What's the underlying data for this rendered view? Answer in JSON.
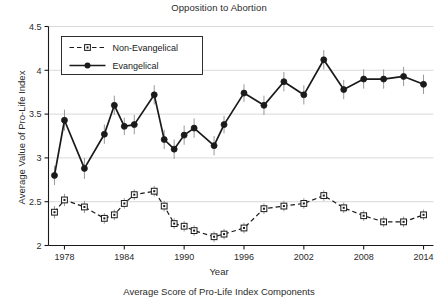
{
  "chart_data": {
    "type": "line",
    "title": "Opposition to Abortion",
    "caption": "Average Score of Pro-Life Index Components",
    "xlabel": "Year",
    "ylabel": "Average Value of Pro-Life Index",
    "xlim": [
      1976.4,
      2015.0
    ],
    "ylim": [
      2.0,
      4.5
    ],
    "xticks": [
      1978,
      1984,
      1990,
      1996,
      2002,
      2008,
      2014
    ],
    "yticks": [
      2,
      2.5,
      3,
      3.5,
      4,
      4.5
    ],
    "ytick_labels": [
      "2",
      "2.5",
      "3",
      "3.5",
      "4",
      "4.5"
    ],
    "xtick_labels": [
      "1978",
      "1984",
      "1990",
      "1996",
      "2002",
      "2008",
      "2014"
    ],
    "grid": "horizontal",
    "legend_position": "top-left",
    "error_bars": true,
    "series": [
      {
        "name": "Evangelical",
        "marker": "filled-circle",
        "linestyle": "solid",
        "color": "#1a1a1a",
        "x": [
          1977,
          1978,
          1980,
          1982,
          1983,
          1984,
          1985,
          1987,
          1988,
          1989,
          1990,
          1991,
          1993,
          1994,
          1996,
          1998,
          2000,
          2002,
          2004,
          2006,
          2008,
          2010,
          2012,
          2014
        ],
        "y": [
          2.8,
          3.43,
          2.88,
          3.27,
          3.6,
          3.36,
          3.38,
          3.72,
          3.21,
          3.1,
          3.26,
          3.34,
          3.14,
          3.38,
          3.74,
          3.6,
          3.87,
          3.72,
          4.12,
          3.78,
          3.9,
          3.9,
          3.93,
          3.84
        ],
        "yerr": [
          0.11,
          0.12,
          0.12,
          0.11,
          0.11,
          0.1,
          0.11,
          0.11,
          0.11,
          0.11,
          0.11,
          0.11,
          0.11,
          0.1,
          0.1,
          0.11,
          0.11,
          0.11,
          0.11,
          0.11,
          0.11,
          0.11,
          0.11,
          0.11
        ]
      },
      {
        "name": "Non-Evangelical",
        "marker": "open-square",
        "linestyle": "dashed",
        "color": "#1a1a1a",
        "x": [
          1977,
          1978,
          1980,
          1982,
          1983,
          1984,
          1985,
          1987,
          1988,
          1989,
          1990,
          1991,
          1993,
          1994,
          1996,
          1998,
          2000,
          2002,
          2004,
          2006,
          2008,
          2010,
          2012,
          2014
        ],
        "y": [
          2.38,
          2.52,
          2.44,
          2.31,
          2.35,
          2.48,
          2.58,
          2.62,
          2.45,
          2.25,
          2.22,
          2.17,
          2.1,
          2.13,
          2.2,
          2.42,
          2.45,
          2.48,
          2.57,
          2.43,
          2.34,
          2.27,
          2.27,
          2.35
        ],
        "yerr": [
          0.07,
          0.07,
          0.07,
          0.06,
          0.06,
          0.06,
          0.06,
          0.06,
          0.06,
          0.06,
          0.06,
          0.06,
          0.06,
          0.06,
          0.06,
          0.06,
          0.06,
          0.06,
          0.06,
          0.06,
          0.06,
          0.06,
          0.06,
          0.06
        ]
      }
    ],
    "legend": [
      {
        "label": "Non-Evangelical",
        "marker": "open-square",
        "linestyle": "dashed"
      },
      {
        "label": "Evangelical",
        "marker": "filled-circle",
        "linestyle": "solid"
      }
    ]
  }
}
